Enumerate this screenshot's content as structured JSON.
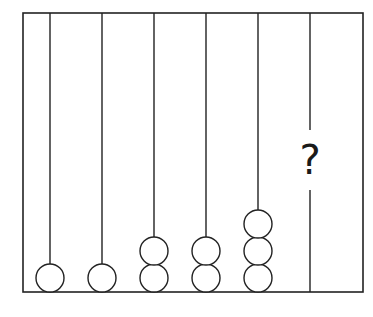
{
  "diagram": {
    "frame": {
      "x": 23,
      "y": 13,
      "width": 340,
      "height": 279,
      "stroke": "#222222"
    },
    "rods": [
      {
        "index": 1,
        "x": 50,
        "beads": 1
      },
      {
        "index": 2,
        "x": 102,
        "beads": 1
      },
      {
        "index": 3,
        "x": 154,
        "beads": 2
      },
      {
        "index": 4,
        "x": 206,
        "beads": 2
      },
      {
        "index": 5,
        "x": 258,
        "beads": 3
      },
      {
        "index": 6,
        "x": 310,
        "beads": null,
        "label": "?"
      }
    ],
    "bead_radius": 14,
    "bead_spacing": 27,
    "bead_base_y": 278,
    "unknown_label": "?",
    "question_gap": {
      "top": 130,
      "bottom": 190
    }
  }
}
